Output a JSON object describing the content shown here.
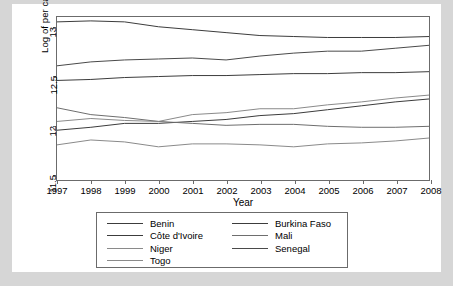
{
  "chart_data": {
    "type": "line",
    "title": "",
    "xlabel": "Year",
    "ylabel": "Log of per capita GDP",
    "x": [
      1997,
      1998,
      1999,
      2000,
      2001,
      2002,
      2003,
      2004,
      2005,
      2006,
      2007,
      2008
    ],
    "xtick_labels": [
      "1997",
      "1998",
      "1999",
      "2000",
      "2001",
      "2002",
      "2003",
      "2004",
      "2005",
      "2006",
      "2007",
      "2008"
    ],
    "ytick_labels": [
      "11.5",
      "12",
      "12.5",
      "13"
    ],
    "ytick_values": [
      11.5,
      12,
      12.5,
      13
    ],
    "xlim": [
      1997,
      2008
    ],
    "ylim": [
      11.43,
      13.1
    ],
    "grid": false,
    "legend_position": "below-plot",
    "legend_columns": 2,
    "series": [
      {
        "name": "Benin",
        "color": "#3c3c3c",
        "values": [
          12.45,
          12.46,
          12.48,
          12.49,
          12.5,
          12.5,
          12.51,
          12.52,
          12.52,
          12.53,
          12.53,
          12.54
        ]
      },
      {
        "name": "Burkina Faso",
        "color": "#3c3c3c",
        "values": [
          11.94,
          11.97,
          12.01,
          12.01,
          12.03,
          12.05,
          12.09,
          12.11,
          12.15,
          12.19,
          12.23,
          12.26
        ]
      },
      {
        "name": "Côte d'Ivoire",
        "color": "#3c3c3c",
        "values": [
          13.05,
          13.06,
          13.05,
          13.0,
          12.97,
          12.94,
          12.91,
          12.9,
          12.89,
          12.89,
          12.89,
          12.9
        ]
      },
      {
        "name": "Mali",
        "color": "#6e6e6e",
        "values": [
          12.17,
          12.1,
          12.07,
          12.03,
          12.01,
          11.99,
          12.0,
          12.0,
          11.98,
          11.97,
          11.97,
          11.98
        ]
      },
      {
        "name": "Niger",
        "color": "#8a8a8a",
        "values": [
          12.03,
          12.06,
          12.04,
          12.03,
          12.1,
          12.12,
          12.16,
          12.16,
          12.2,
          12.23,
          12.27,
          12.3
        ]
      },
      {
        "name": "Senegal",
        "color": "#4a4a4a",
        "values": [
          12.6,
          12.64,
          12.66,
          12.67,
          12.68,
          12.66,
          12.7,
          12.73,
          12.75,
          12.75,
          12.78,
          12.81
        ]
      },
      {
        "name": "Togo",
        "color": "#8a8a8a",
        "values": [
          11.79,
          11.84,
          11.82,
          11.77,
          11.8,
          11.8,
          11.79,
          11.77,
          11.8,
          11.81,
          11.83,
          11.86
        ]
      }
    ],
    "legend_entries": [
      {
        "label": "Benin",
        "color": "#3c3c3c"
      },
      {
        "label": "Burkina Faso",
        "color": "#3c3c3c"
      },
      {
        "label": "Côte d'Ivoire",
        "color": "#3c3c3c"
      },
      {
        "label": "Mali",
        "color": "#6e6e6e"
      },
      {
        "label": "Niger",
        "color": "#8a8a8a"
      },
      {
        "label": "Senegal",
        "color": "#4a4a4a"
      },
      {
        "label": "Togo",
        "color": "#8a8a8a"
      }
    ]
  }
}
